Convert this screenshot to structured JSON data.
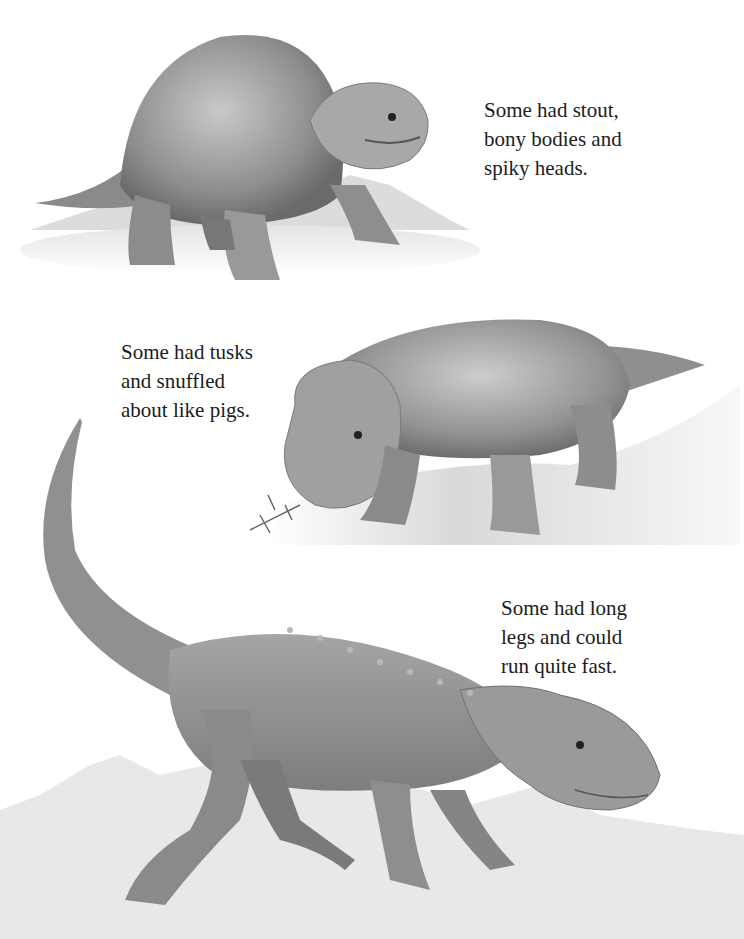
{
  "page": {
    "background": "#ffffff",
    "text_color": "#1c1c1c"
  },
  "captions": [
    {
      "id": "stout-bodies",
      "lines": [
        "Some had stout,",
        "bony bodies and",
        "spiky heads."
      ]
    },
    {
      "id": "tusks",
      "lines": [
        "Some had tusks",
        "and snuffled",
        "about like pigs."
      ]
    },
    {
      "id": "long-legs",
      "lines": [
        "Some had long",
        "legs and could",
        "run quite fast."
      ]
    }
  ],
  "illustrations": [
    {
      "id": "stout-spiky-dinosaur",
      "description": "Stout-bodied reptile with bony spiky head, standing on ground with hills behind"
    },
    {
      "id": "tusked-dinosaur",
      "description": "Tusked reptile snuffling the ground, holding a plant sprig in its mouth"
    },
    {
      "id": "long-legged-dinosaur",
      "description": "Long-legged, long-tailed reptile with armored back, walking over rocky terrain"
    }
  ]
}
